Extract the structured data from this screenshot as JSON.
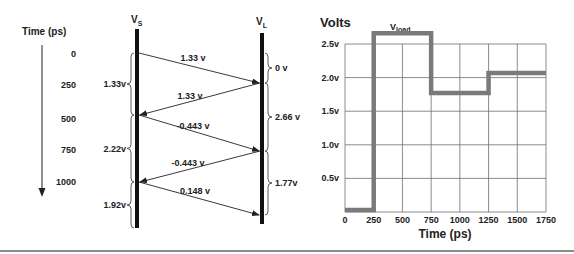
{
  "timeline": {
    "title": "Time (ps)",
    "ticks": [
      {
        "label": "0",
        "y": 57
      },
      {
        "label": "250",
        "y": 88
      },
      {
        "label": "500",
        "y": 122
      },
      {
        "label": "750",
        "y": 153
      },
      {
        "label": "1000",
        "y": 185
      }
    ]
  },
  "lattice": {
    "source_label": "V",
    "source_sub": "S",
    "load_label": "V",
    "load_sub": "L",
    "waves": [
      {
        "label": "1.33 v",
        "from": "S",
        "y1": 53,
        "y2": 83,
        "lx": 193,
        "ly": 61
      },
      {
        "label": "1.33 v",
        "from": "L",
        "y1": 83,
        "y2": 115,
        "lx": 190,
        "ly": 99
      },
      {
        "label": "-0.443 v",
        "from": "S",
        "y1": 115,
        "y2": 151,
        "lx": 193,
        "ly": 129
      },
      {
        "label": "-0.443 v",
        "from": "L",
        "y1": 151,
        "y2": 182,
        "lx": 188,
        "ly": 166
      },
      {
        "label": "0.148 v",
        "from": "S",
        "y1": 182,
        "y2": 215,
        "lx": 195,
        "ly": 194
      }
    ],
    "source_voltages": [
      {
        "label": "1.33v",
        "y1": 53,
        "y2": 115
      },
      {
        "label": "2.22v",
        "y1": 115,
        "y2": 182
      },
      {
        "label": "1.92v",
        "y1": 182,
        "y2": 228
      }
    ],
    "load_voltages": [
      {
        "label": "0 v",
        "y1": 53,
        "y2": 83
      },
      {
        "label": "2.66 v",
        "y1": 83,
        "y2": 151
      },
      {
        "label": "1.77v",
        "y1": 151,
        "y2": 215
      }
    ]
  },
  "chart_data": {
    "type": "line",
    "title": "Volts",
    "series_label": "V",
    "series_sub": "load",
    "xlabel": "Time (ps)",
    "ylabel": "Volts",
    "x_ticks": [
      "0",
      "250",
      "500",
      "750",
      "1000",
      "1250",
      "1500",
      "1750"
    ],
    "y_ticks": [
      "0.5v",
      "1.0v",
      "1.5v",
      "2.0v",
      "2.5v"
    ],
    "xlim": [
      0,
      1750
    ],
    "ylim": [
      0,
      2.5
    ],
    "grid": true,
    "step_points": [
      {
        "x": 0,
        "y": 0
      },
      {
        "x": 250,
        "y": 0
      },
      {
        "x": 250,
        "y": 2.66
      },
      {
        "x": 750,
        "y": 2.66
      },
      {
        "x": 750,
        "y": 1.77
      },
      {
        "x": 1250,
        "y": 1.77
      },
      {
        "x": 1250,
        "y": 2.07
      },
      {
        "x": 1750,
        "y": 2.07
      }
    ],
    "series": [
      {
        "name": "Vload",
        "x": [
          0,
          250,
          750,
          1250,
          1750
        ],
        "values": [
          0,
          2.66,
          1.77,
          2.07,
          2.07
        ]
      }
    ],
    "colors": {
      "trace": "#7a7a7a",
      "grid": "#6f6f6f"
    }
  }
}
